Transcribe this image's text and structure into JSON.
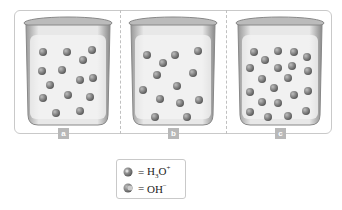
{
  "panels": [
    {
      "label": "a",
      "description": "acidic-like mixture: mostly H3O+ and OH- pairs"
    },
    {
      "label": "b",
      "description": "mixture with OH- ions"
    },
    {
      "label": "c",
      "description": "mixture with many ions"
    }
  ],
  "legend": {
    "items": [
      {
        "icon": "hydronium-ion-icon",
        "equals": "=",
        "formula": "H",
        "sub": "3",
        "formula2": "O",
        "sup": "+"
      },
      {
        "icon": "hydroxide-ion-icon",
        "equals": "=",
        "formula": "OH",
        "sup": "−"
      }
    ]
  },
  "colors": {
    "frame": "#c9c9c9",
    "tag": "#b8b8b8",
    "molecule": "#6e6e6e",
    "glass": "#e4e4e4"
  }
}
